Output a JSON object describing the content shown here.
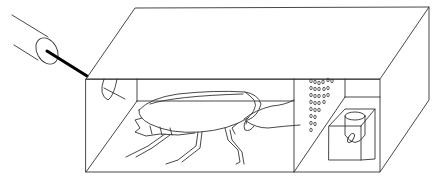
{
  "diagram": {
    "colors": {
      "line": "#333333",
      "background": "#ffffff",
      "rod": "#000000"
    },
    "components": [
      {
        "id": "tube",
        "label": "cylindrical tube with rod"
      },
      {
        "id": "box",
        "label": "rectangular chamber"
      },
      {
        "id": "cockroach",
        "label": "cockroach"
      },
      {
        "id": "perforated-partition",
        "label": "perforated partition wall"
      },
      {
        "id": "side-compartment-cube",
        "label": "transparent cube"
      },
      {
        "id": "vial",
        "label": "vial containing object"
      }
    ]
  }
}
